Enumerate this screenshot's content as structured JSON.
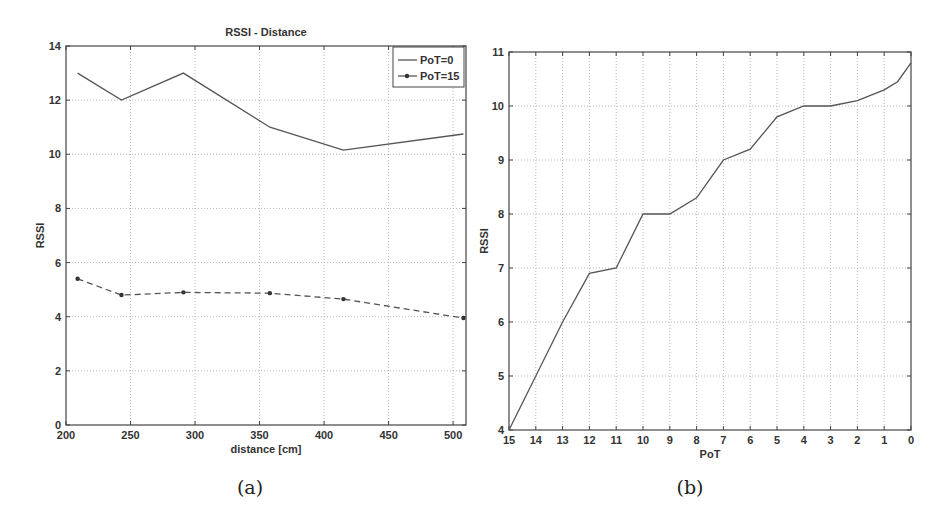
{
  "chart_data": [
    {
      "type": "line",
      "panel": "(a)",
      "title": "RSSI - Distance",
      "xlabel": "distance [cm]",
      "ylabel": "RSSI",
      "xlim": [
        200,
        510
      ],
      "ylim": [
        0,
        14
      ],
      "xticks": [
        200,
        250,
        300,
        350,
        400,
        450,
        500
      ],
      "yticks": [
        0,
        2,
        4,
        6,
        8,
        10,
        12,
        14
      ],
      "grid": true,
      "legend_position": "top-right",
      "x": [
        209,
        243,
        291,
        358,
        415,
        508
      ],
      "series": [
        {
          "name": "PoT=0",
          "style": "solid",
          "marker": "none",
          "values": [
            13,
            12,
            13,
            11,
            10.15,
            10.75
          ]
        },
        {
          "name": "PoT=15",
          "style": "dashed",
          "marker": "dot",
          "values": [
            5.4,
            4.8,
            4.9,
            4.87,
            4.65,
            3.95
          ]
        }
      ]
    },
    {
      "type": "line",
      "panel": "(b)",
      "title": "",
      "xlabel": "PoT",
      "ylabel": "RSSI",
      "xlim": [
        15,
        0
      ],
      "ylim": [
        4,
        11
      ],
      "xticks": [
        15,
        14,
        13,
        12,
        11,
        10,
        9,
        8,
        7,
        6,
        5,
        4,
        3,
        2,
        1,
        0
      ],
      "yticks": [
        4,
        5,
        6,
        7,
        8,
        9,
        10,
        11
      ],
      "grid": true,
      "x": [
        15,
        14,
        13,
        12,
        11,
        10,
        9,
        8,
        7,
        6,
        5,
        4,
        3,
        2,
        1,
        0.5,
        0
      ],
      "series": [
        {
          "name": "RSSI",
          "style": "solid",
          "values": [
            4.0,
            5.0,
            6.0,
            6.9,
            7.0,
            8.0,
            8.0,
            8.3,
            9.0,
            9.2,
            9.8,
            10.0,
            10.0,
            10.1,
            10.3,
            10.45,
            10.8
          ]
        }
      ]
    }
  ],
  "captions": {
    "a": "(a)",
    "b": "(b)"
  }
}
